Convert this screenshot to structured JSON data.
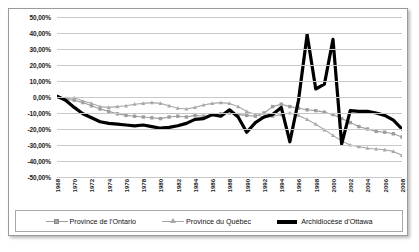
{
  "chart_data": {
    "type": "line",
    "title": "",
    "xlabel": "",
    "ylabel": "",
    "ylim": [
      -50,
      50
    ],
    "ytick_step": 10,
    "grid": true,
    "legend_position": "bottom",
    "ytick_labels": [
      "50,00%",
      "40,00%",
      "30,00%",
      "20,00%",
      "10,00%",
      "0,00%",
      "-10,00%",
      "-20,00%",
      "-30,00%",
      "-40,00%",
      "-50,00%"
    ],
    "ytick_values": [
      50,
      40,
      30,
      20,
      10,
      0,
      -10,
      -20,
      -30,
      -40,
      -50
    ],
    "x": [
      1968,
      1969,
      1970,
      1971,
      1972,
      1973,
      1974,
      1975,
      1976,
      1977,
      1978,
      1979,
      1980,
      1981,
      1982,
      1983,
      1984,
      1985,
      1986,
      1987,
      1988,
      1989,
      1990,
      1991,
      1992,
      1993,
      1994,
      1995,
      1996,
      1997,
      1998,
      1999,
      2000,
      2001,
      2002,
      2003,
      2004,
      2005,
      2006,
      2007,
      2008
    ],
    "xtick_labels": [
      "1968",
      "1970",
      "1972",
      "1974",
      "1976",
      "1978",
      "1980",
      "1982",
      "1984",
      "1986",
      "1988",
      "1990",
      "1992",
      "1994",
      "1996",
      "1998",
      "2000",
      "2002",
      "2004",
      "2006",
      "2008"
    ],
    "series": [
      {
        "name": "Province de l'Ontario",
        "marker": "square",
        "color": "#9d9d9d",
        "values": [
          0.0,
          -1.5,
          -2.0,
          -3.5,
          -5.5,
          -7.5,
          -9.0,
          -10.5,
          -11.5,
          -12.0,
          -12.5,
          -13.0,
          -13.5,
          -12.5,
          -12.0,
          -12.5,
          -11.5,
          -12.0,
          -11.0,
          -10.5,
          -10.0,
          -11.0,
          -11.5,
          -12.0,
          -10.0,
          -6.0,
          -4.5,
          -6.0,
          -7.0,
          -8.0,
          -8.5,
          -9.5,
          -11.0,
          -13.5,
          -16.0,
          -18.5,
          -20.0,
          -21.5,
          -22.0,
          -23.0,
          -25.0
        ]
      },
      {
        "name": "Province du Québec",
        "marker": "triangle",
        "color": "#a8a8a8",
        "values": [
          0.0,
          -1.0,
          -0.5,
          -2.5,
          -4.0,
          -6.0,
          -6.5,
          -6.0,
          -5.5,
          -4.5,
          -4.0,
          -3.5,
          -4.0,
          -5.5,
          -7.0,
          -7.5,
          -6.5,
          -5.0,
          -4.0,
          -3.5,
          -4.0,
          -6.0,
          -9.0,
          -11.0,
          -12.5,
          -12.0,
          -11.0,
          -10.0,
          -11.5,
          -14.0,
          -17.0,
          -20.5,
          -24.0,
          -27.5,
          -30.0,
          -31.0,
          -32.0,
          -32.5,
          -33.0,
          -34.0,
          -36.5
        ]
      },
      {
        "name": "Archidiocèse d'Ottawa",
        "marker": "none",
        "color": "#000000",
        "values": [
          0.5,
          -2.0,
          -6.5,
          -10.5,
          -13.0,
          -15.5,
          -16.5,
          -17.0,
          -17.5,
          -18.0,
          -17.5,
          -18.5,
          -19.5,
          -19.0,
          -18.0,
          -16.5,
          -14.0,
          -13.5,
          -11.0,
          -12.0,
          -8.0,
          -12.5,
          -22.0,
          -16.0,
          -12.5,
          -11.0,
          -6.5,
          -28.0,
          -2.0,
          39.0,
          5.0,
          8.0,
          36.0,
          -29.5,
          -8.5,
          -9.0,
          -9.0,
          -10.0,
          -11.5,
          -14.5,
          -20.0
        ]
      }
    ]
  },
  "legend": {
    "items": [
      {
        "label": "Province de l'Ontario"
      },
      {
        "label": "Province du Québec"
      },
      {
        "label": "Archidiocèse d'Ottawa"
      }
    ]
  }
}
